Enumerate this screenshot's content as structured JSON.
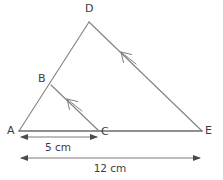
{
  "figure": {
    "background_color": "#ffffff",
    "stroke_color": "#808080",
    "baseline_color": "#6e6e6e",
    "label_color": "#3c3c3c",
    "width": 223,
    "height": 180
  },
  "vertices": [
    {
      "id": "A",
      "label": "A",
      "x": 19,
      "y": 131,
      "label_x": 7,
      "label_y": 125
    },
    {
      "id": "B",
      "label": "B",
      "x": 51,
      "y": 85,
      "label_x": 38,
      "label_y": 73
    },
    {
      "id": "C",
      "label": "C",
      "x": 99,
      "y": 131,
      "label_x": 101,
      "label_y": 126
    },
    {
      "id": "D",
      "label": "D",
      "x": 89,
      "y": 22,
      "label_x": 85,
      "label_y": 3
    },
    {
      "id": "E",
      "label": "E",
      "x": 202,
      "y": 131,
      "label_x": 205,
      "label_y": 125
    }
  ],
  "segments": [
    {
      "name": "segment-AD",
      "from": "A",
      "to": "D"
    },
    {
      "name": "segment-DE",
      "from": "D",
      "to": "E"
    },
    {
      "name": "segment-AE",
      "from": "A",
      "to": "E"
    },
    {
      "name": "segment-BC",
      "from": "B",
      "to": "C"
    }
  ],
  "parallel_marks": [
    {
      "name": "arrow-mark-DE",
      "on_segment": "segment-DE",
      "direction": "toward-D",
      "tip_x": 121,
      "tip_y": 52,
      "tail_x": 136,
      "tail_y": 64
    },
    {
      "name": "arrow-mark-BC",
      "on_segment": "segment-BC",
      "direction": "toward-B",
      "tip_x": 67,
      "tip_y": 99,
      "tail_x": 82,
      "tail_y": 111
    }
  ],
  "dimensions": [
    {
      "name": "dimension-AC",
      "label": "5 cm",
      "value": 5,
      "unit": "cm",
      "from_x": 21,
      "to_x": 97,
      "line_y": 137,
      "label_center_x": 58,
      "label_y": 142
    },
    {
      "name": "dimension-AE",
      "label": "12 cm",
      "value": 12,
      "unit": "cm",
      "from_x": 21,
      "to_x": 200,
      "line_y": 158,
      "label_center_x": 110,
      "label_y": 163
    }
  ]
}
